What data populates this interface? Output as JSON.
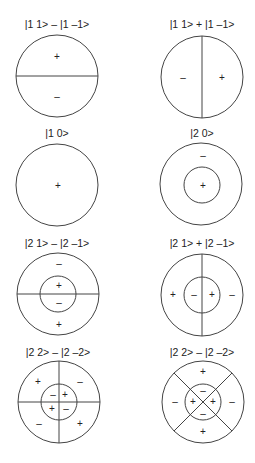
{
  "diagram": {
    "panels": [
      {
        "id": "p1",
        "label": "|1 1> – |1 –1>",
        "center": [
          57,
          76
        ],
        "outer_r": 41,
        "inner_r": 0,
        "lines": [
          "horizontal"
        ],
        "signs": [
          {
            "text": "+",
            "x": 57,
            "y": 60
          },
          {
            "text": "–",
            "x": 57,
            "y": 100
          }
        ]
      },
      {
        "id": "p2",
        "label": "|1 1> + |1 –1>",
        "center": [
          202,
          77
        ],
        "outer_r": 41,
        "inner_r": 0,
        "lines": [
          "vertical"
        ],
        "signs": [
          {
            "text": "–",
            "x": 183,
            "y": 81
          },
          {
            "text": "+",
            "x": 222,
            "y": 81
          }
        ]
      },
      {
        "id": "p3",
        "label": "|1 0>",
        "center": [
          57,
          185
        ],
        "outer_r": 41,
        "inner_r": 0,
        "lines": [],
        "signs": [
          {
            "text": "+",
            "x": 58,
            "y": 189
          }
        ]
      },
      {
        "id": "p4",
        "label": "|2 0>",
        "center": [
          201,
          184
        ],
        "outer_r": 41,
        "inner_r": 18,
        "lines": [],
        "signs": [
          {
            "text": "–",
            "x": 203,
            "y": 159
          },
          {
            "text": "+",
            "x": 203,
            "y": 189
          }
        ]
      },
      {
        "id": "p5",
        "label": "|2 1> – |2 –1>",
        "center": [
          58,
          294
        ],
        "outer_r": 41,
        "inner_r": 18,
        "lines": [
          "horizontal"
        ],
        "signs": [
          {
            "text": "–",
            "x": 59,
            "y": 267
          },
          {
            "text": "+",
            "x": 59,
            "y": 289
          },
          {
            "text": "–",
            "x": 59,
            "y": 306
          },
          {
            "text": "+",
            "x": 59,
            "y": 328
          }
        ]
      },
      {
        "id": "p6",
        "label": "|2 1> + |2 –1>",
        "center": [
          202,
          295
        ],
        "outer_r": 41,
        "inner_r": 18,
        "lines": [
          "vertical"
        ],
        "signs": [
          {
            "text": "+",
            "x": 173,
            "y": 298
          },
          {
            "text": "–",
            "x": 194,
            "y": 298
          },
          {
            "text": "+",
            "x": 212,
            "y": 298
          },
          {
            "text": "–",
            "x": 232,
            "y": 298
          }
        ]
      },
      {
        "id": "p7",
        "label": "|2 2> – |2 –2>",
        "center": [
          59,
          402
        ],
        "outer_r": 41,
        "inner_r": 18,
        "lines": [
          "horizontal",
          "vertical"
        ],
        "signs": [
          {
            "text": "+",
            "x": 38,
            "y": 385
          },
          {
            "text": "–",
            "x": 80,
            "y": 385
          },
          {
            "text": "–",
            "x": 53,
            "y": 398
          },
          {
            "text": "+",
            "x": 65,
            "y": 398
          },
          {
            "text": "+",
            "x": 52,
            "y": 411
          },
          {
            "text": "–",
            "x": 66,
            "y": 411
          },
          {
            "text": "–",
            "x": 39,
            "y": 427
          },
          {
            "text": "+",
            "x": 80,
            "y": 427
          }
        ]
      },
      {
        "id": "p8",
        "label": "|2 2> – |2 –2>",
        "center": [
          203,
          402
        ],
        "outer_r": 41,
        "inner_r": 18,
        "lines": [
          "diagonal"
        ],
        "signs": [
          {
            "text": "+",
            "x": 203,
            "y": 375
          },
          {
            "text": "–",
            "x": 203,
            "y": 394
          },
          {
            "text": "–",
            "x": 175,
            "y": 405
          },
          {
            "text": "+",
            "x": 193,
            "y": 405
          },
          {
            "text": "+",
            "x": 213,
            "y": 405
          },
          {
            "text": "–",
            "x": 232,
            "y": 405
          },
          {
            "text": "–",
            "x": 203,
            "y": 416
          },
          {
            "text": "+",
            "x": 203,
            "y": 435
          }
        ]
      }
    ],
    "label_positions": [
      [
        57,
        28
      ],
      [
        202,
        28
      ],
      [
        57,
        137
      ],
      [
        202,
        137
      ],
      [
        57,
        247
      ],
      [
        202,
        247
      ],
      [
        57,
        356
      ],
      [
        202,
        356
      ]
    ]
  }
}
